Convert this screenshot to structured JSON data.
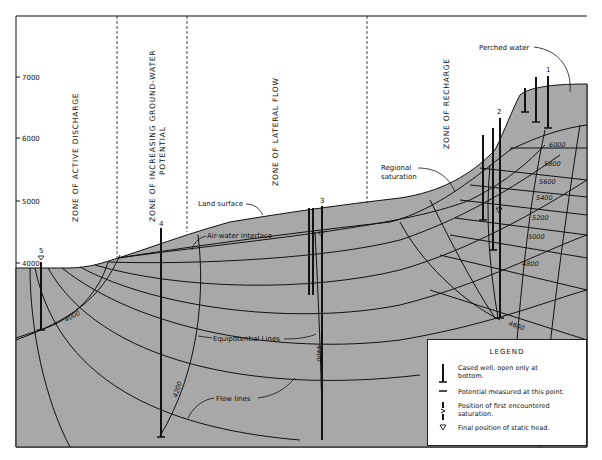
{
  "diagram": {
    "type": "hydrogeologic cross-section",
    "colors": {
      "saturated_fill": "#a8a8a8",
      "lines": "#111111",
      "background": "#ffffff"
    },
    "y_axis": {
      "ticks": [
        "7000",
        "6000",
        "5000",
        "4000"
      ]
    },
    "zones": [
      {
        "label": "ZONE OF ACTIVE DISCHARGE"
      },
      {
        "label_line1": "ZONE OF INCREASING GROUND-WATER",
        "label_line2": "POTENTIAL"
      },
      {
        "label": "ZONE OF LATERAL FLOW"
      },
      {
        "label": "ZONE OF RECHARGE"
      }
    ],
    "callouts": {
      "perched_water": "Perched water",
      "regional_saturation_1": "Regional",
      "regional_saturation_2": "saturation",
      "land_surface": "Land surface",
      "air_water_interface": "Air-water interface",
      "equipotential_lines": "Equipotential Lines",
      "flow_lines": "Flow lines"
    },
    "wells": [
      {
        "id": "1"
      },
      {
        "id": "2"
      },
      {
        "id": "3"
      },
      {
        "id": "4"
      },
      {
        "id": "5"
      }
    ],
    "equipotential_labels": [
      "6000",
      "5800",
      "5600",
      "5400",
      "5200",
      "5000",
      "4800",
      "4600",
      "4400",
      "4200",
      "4000"
    ]
  },
  "legend": {
    "title": "LEGEND",
    "items": [
      {
        "symbol": "cased-well",
        "line1": "Cased well, open only at",
        "line2": "bottom."
      },
      {
        "symbol": "potential-measured",
        "line1": "Potential measured at this point.",
        "line2": ""
      },
      {
        "symbol": "first-saturation",
        "line1": "Position of first encountered",
        "line2": "saturation."
      },
      {
        "symbol": "static-head",
        "line1": "Final position of static head.",
        "line2": ""
      }
    ]
  }
}
